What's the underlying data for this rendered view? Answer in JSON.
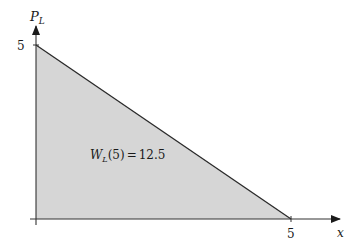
{
  "diagram": {
    "type": "area_under_line",
    "y_axis_label": "P",
    "y_axis_label_sub": "L",
    "x_axis_label": "x",
    "y_tick_label": "5",
    "x_tick_label": "5",
    "annotation": {
      "func": "W",
      "sub": "L",
      "arg": "(5)",
      "equals": "=",
      "value": "12.5"
    },
    "colors": {
      "fill": "#d6d6d6",
      "line": "#2a2a2a",
      "axis": "#333333"
    }
  }
}
